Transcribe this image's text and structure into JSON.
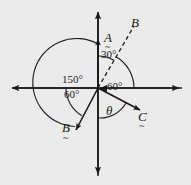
{
  "figure": {
    "background_color": "#ebebeb",
    "stroke_color": "#1a1a1a",
    "origin": {
      "x": 98,
      "y": 88
    }
  },
  "axes": {
    "horizontal": {
      "label": "",
      "x1": 8,
      "y1": 88,
      "x2": 183,
      "y2": 88,
      "arrows": "both"
    },
    "vertical": {
      "label": "",
      "x1": 98,
      "y1": 8,
      "x2": 98,
      "y2": 178,
      "arrows": "both"
    }
  },
  "vectors": [
    {
      "name": "vector-a",
      "label": "A",
      "underline_tilde": "~",
      "direction_deg": 90,
      "style": "solid",
      "label_pos": {
        "x": 104,
        "y": 37
      },
      "tilde_pos": {
        "x": 105,
        "y": 48
      }
    },
    {
      "name": "vector-b-dashed",
      "label": "B",
      "underline_tilde": "",
      "direction_deg": 60,
      "style": "dashed",
      "label_pos": {
        "x": 131,
        "y": 22
      },
      "tilde_pos": null
    },
    {
      "name": "vector-b",
      "label": "B",
      "underline_tilde": "~",
      "direction_deg": 240,
      "style": "solid",
      "label_pos": {
        "x": 62,
        "y": 127
      },
      "tilde_pos": {
        "x": 63,
        "y": 139
      }
    },
    {
      "name": "vector-c",
      "label": "C",
      "underline_tilde": "~",
      "direction_deg": -30,
      "style": "solid",
      "label_pos": {
        "x": 138,
        "y": 116
      },
      "tilde_pos": {
        "x": 139,
        "y": 127
      }
    }
  ],
  "angles": [
    {
      "name": "angle-30",
      "label": "30°",
      "pos": {
        "x": 101,
        "y": 55
      }
    },
    {
      "name": "angle-150",
      "label": "150°",
      "pos": {
        "x": 62,
        "y": 80
      }
    },
    {
      "name": "angle-60-left",
      "label": "60°",
      "pos": {
        "x": 64,
        "y": 95
      }
    },
    {
      "name": "angle-60-right",
      "label": "60°",
      "pos": {
        "x": 105,
        "y": 80
      }
    },
    {
      "name": "angle-theta",
      "label": "θ",
      "pos": {
        "x": 106,
        "y": 110
      }
    }
  ]
}
